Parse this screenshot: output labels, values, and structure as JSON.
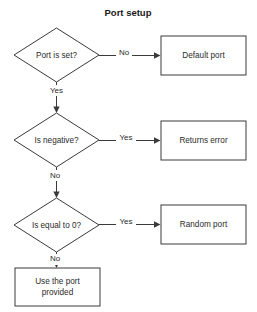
{
  "title": "Port setup",
  "diagram": {
    "nodes": [
      {
        "id": "port-is-set",
        "type": "decision",
        "label": "Port is set?"
      },
      {
        "id": "default-port",
        "type": "process",
        "label": "Default port"
      },
      {
        "id": "is-negative",
        "type": "decision",
        "label": "Is negative?"
      },
      {
        "id": "returns-error",
        "type": "process",
        "label": "Returns error"
      },
      {
        "id": "is-equal-to-zero",
        "type": "decision",
        "label": "Is equal to 0?"
      },
      {
        "id": "random-port",
        "type": "process",
        "label": "Random port"
      },
      {
        "id": "use-the-port",
        "type": "process",
        "label_line1": "Use the port",
        "label_line2": "provided"
      }
    ],
    "edges": [
      {
        "id": "edge-port-is-set-no",
        "from": "port-is-set",
        "to": "default-port",
        "label": "No"
      },
      {
        "id": "edge-port-is-set-yes",
        "from": "port-is-set",
        "to": "is-negative",
        "label": "Yes"
      },
      {
        "id": "edge-is-negative-yes",
        "from": "is-negative",
        "to": "returns-error",
        "label": "Yes"
      },
      {
        "id": "edge-is-negative-no",
        "from": "is-negative",
        "to": "is-equal-to-zero",
        "label": "No"
      },
      {
        "id": "edge-is-zero-yes",
        "from": "is-equal-to-zero",
        "to": "random-port",
        "label": "Yes"
      },
      {
        "id": "edge-is-zero-no",
        "from": "is-equal-to-zero",
        "to": "use-the-port",
        "label": "No"
      }
    ]
  },
  "colors": {
    "background": "#ffffff",
    "stroke": "#3a3a3a",
    "text": "#2b2b2b",
    "title": "#1a1a1a"
  }
}
